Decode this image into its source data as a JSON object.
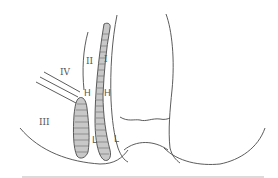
{
  "figure": {
    "type": "anatomical-schematic",
    "labels": {
      "region_1": "I",
      "region_2": "II",
      "region_3": "III",
      "region_4": "IV",
      "upper_marker_left": "H",
      "upper_marker_right": "H",
      "lower_marker_left": "L",
      "lower_marker_right": "L"
    },
    "colors": {
      "stroke": "#4a4a4a",
      "hatch_fill": "#c8c8c8",
      "baseline": "#b8b8b8",
      "background": "#ffffff"
    }
  }
}
